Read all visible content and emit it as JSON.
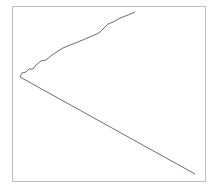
{
  "chart_data": {
    "type": "line",
    "title": "",
    "xlabel": "",
    "ylabel": "",
    "grid": false,
    "legend": null,
    "frame": {
      "x0": 12,
      "y0": 6,
      "x1": 205,
      "y1": 181,
      "color": "#bdbdbd"
    },
    "series": [
      {
        "name": "upper",
        "color": "#6e6e6e",
        "points_px": [
          [
            20,
            77
          ],
          [
            22,
            73
          ],
          [
            26,
            72
          ],
          [
            29,
            69
          ],
          [
            33,
            69
          ],
          [
            36,
            65
          ],
          [
            41,
            61
          ],
          [
            46,
            60
          ],
          [
            52,
            55
          ],
          [
            58,
            51
          ],
          [
            63,
            48
          ],
          [
            70,
            45
          ],
          [
            78,
            42
          ],
          [
            85,
            39
          ],
          [
            92,
            36
          ],
          [
            99,
            33
          ],
          [
            104,
            28
          ],
          [
            108,
            24
          ],
          [
            113,
            22
          ],
          [
            120,
            18
          ],
          [
            128,
            15
          ],
          [
            135,
            12
          ]
        ]
      },
      {
        "name": "lower",
        "color": "#6e6e6e",
        "points_px": [
          [
            20,
            77
          ],
          [
            195,
            174
          ]
        ]
      }
    ]
  }
}
